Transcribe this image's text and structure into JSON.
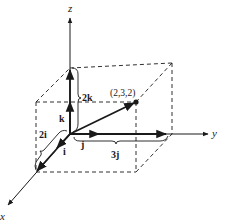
{
  "diagram": {
    "type": "3d-vector-decomposition",
    "axes": {
      "x": {
        "label": "x"
      },
      "y": {
        "label": "y"
      },
      "z": {
        "label": "z"
      }
    },
    "unit_vectors": {
      "i": "i",
      "j": "j",
      "k": "k"
    },
    "components": {
      "x_component": "2i",
      "y_component": "3j",
      "z_component": "2k"
    },
    "point": {
      "label": "(2,3,2)",
      "coords": [
        2,
        3,
        2
      ]
    },
    "colors": {
      "ink": "#1a1a1a",
      "background": "#ffffff"
    }
  }
}
